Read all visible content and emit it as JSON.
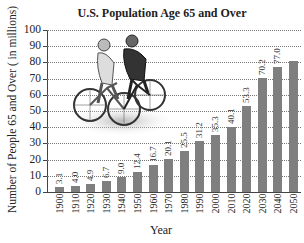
{
  "chart_data": {
    "type": "bar",
    "title": "U.S. Population Age 65 and Over",
    "xlabel": "Year",
    "ylabel": "Number of People 65 and Over ( in millions)",
    "ylim": [
      0,
      100
    ],
    "yticks": [
      0,
      10,
      20,
      30,
      40,
      50,
      60,
      70,
      80,
      90,
      100
    ],
    "grid": true,
    "categories": [
      "1900",
      "1910",
      "1920",
      "1930",
      "1940",
      "1950",
      "1960",
      "1970",
      "1980",
      "1990",
      "2000",
      "2010",
      "2020",
      "2030",
      "2040",
      "2050"
    ],
    "values": [
      3.1,
      4.0,
      4.9,
      6.7,
      9.0,
      12.4,
      16.7,
      20.1,
      25.5,
      31.2,
      35.3,
      40.1,
      53.3,
      70.2,
      77.0,
      80.8
    ],
    "value_labels": [
      "3.1",
      "4.0",
      "4.9",
      "6.7",
      "9.0",
      "12.4",
      "16.7",
      "20.1",
      "25.5",
      "31.2",
      "35.3",
      "40.1",
      "53.3",
      "70.2",
      "77.0",
      ""
    ],
    "bar_color": "#7f7f7f",
    "annotations": [
      "Photo of two cyclists riding bicycles (upper-left of plot area)"
    ]
  },
  "labels": {
    "title": "U.S. Population Age 65 and Over",
    "xlabel": "Year",
    "ylabel": "Number of People 65 and Over ( in millions)"
  }
}
